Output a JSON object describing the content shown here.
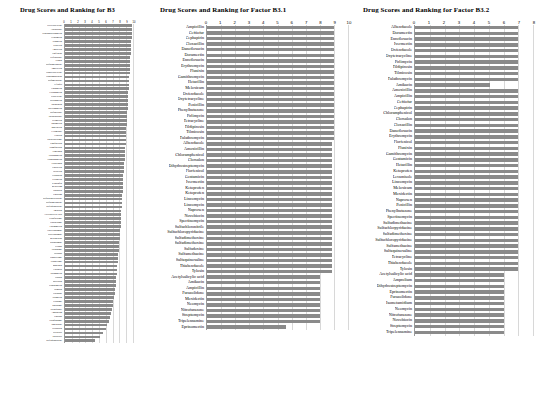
{
  "figure": {
    "background": "#ffffff",
    "bar_color": "#8a8a8a",
    "grid_color": "#d8d8d8",
    "axis_color": "#9a9a9a"
  },
  "chart_data": [
    {
      "id": "B3",
      "type": "bar",
      "orientation": "horizontal",
      "title": "Drug Scores and Ranking for B3",
      "xlabel": "",
      "ylabel": "",
      "xlim": [
        0,
        10
      ],
      "ticks": [
        "0",
        "1",
        "2",
        "3",
        "4",
        "5",
        "6",
        "7",
        "8",
        "9",
        "10"
      ],
      "grid": true,
      "legend": "none",
      "categories": [
        "Oxytetracycline",
        "Albendazole",
        "Dihydrostreptomycin",
        "Gentamicin",
        "Neomycin",
        "Penicillin",
        "Ampicillin",
        "Florfenicol",
        "Oxfendazole",
        "Tylosin",
        "Sulfadimethoxine",
        "Amoxicillin",
        "Chlortetracycline",
        "Chloramphenicol",
        "Sulfamethazine",
        "Ceftiofur",
        "Lincomycin",
        "Erythromycin",
        "Tetracycline",
        "Streptomycin",
        "Novobiocin",
        "Spectinomycin",
        "Sulfathiazole",
        "Thiabendazole",
        "Ivermectin",
        "Doramectin",
        "Moxidectin",
        "Levamisole",
        "Flunixin",
        "Phenylbutazone",
        "Enrofloxacin",
        "Danofloxacin",
        "Tilmicosin",
        "Tulathromycin",
        "Gamithromycin",
        "Tildipirosin",
        "Cloxacillin",
        "Hetacillin",
        "Cephapirin",
        "Pirlimycin",
        "Ketoprofen",
        "Meloxicam",
        "Naproxen",
        "Clorsulon",
        "Sulfachlorpyridazine",
        "Sulfadimethoxine",
        "Sulfaquinoxaline",
        "Amikacin",
        "Acetylsalicylic acid",
        "Nitrofurazone",
        "Furazolidone",
        "Eprinomectin",
        "Triplelennamine",
        "Tripelennamine",
        "Melengestrol",
        "Ractopamine",
        "Zeranol",
        "Trenbolone",
        "Estradiol",
        "Progesterone",
        "Testosterone",
        "Monensin",
        "Lasalocid",
        "Salinomycin",
        "Narasin",
        "Bacitracin",
        "Virginiamycin",
        "Tiamulin",
        "Carbadox",
        "Apramycin",
        "Nitarsone",
        "Roxarsone",
        "Decoquinate",
        "Amprolium",
        "Clopidol",
        "Halofuginone",
        "Robenidine",
        "Nicarbazin",
        "Diclazuril",
        "Toltrazuril",
        "Sulfaquinoxaline"
      ],
      "values": [
        9.9,
        9.85,
        9.8,
        9.8,
        9.75,
        9.7,
        9.7,
        9.65,
        9.6,
        9.6,
        9.55,
        9.5,
        9.5,
        9.45,
        9.4,
        9.4,
        9.35,
        9.3,
        9.3,
        9.25,
        9.2,
        9.2,
        9.15,
        9.1,
        9.1,
        9.05,
        9.0,
        9.0,
        8.95,
        8.9,
        8.9,
        8.85,
        8.8,
        8.8,
        8.75,
        8.7,
        8.7,
        8.65,
        8.6,
        8.6,
        8.55,
        8.5,
        8.5,
        8.45,
        8.4,
        8.4,
        8.35,
        8.3,
        8.3,
        8.25,
        8.2,
        8.2,
        8.15,
        8.1,
        8.05,
        8.0,
        7.95,
        7.9,
        7.85,
        7.8,
        7.75,
        7.7,
        7.65,
        7.6,
        7.55,
        7.5,
        7.45,
        7.4,
        7.3,
        7.2,
        7.1,
        7.0,
        6.9,
        6.8,
        6.6,
        6.4,
        6.2,
        6.0,
        5.6,
        5.2,
        4.4
      ]
    },
    {
      "id": "B3.1",
      "type": "bar",
      "orientation": "horizontal",
      "title": "Drug Scores and Ranking for Factor B3.1",
      "xlabel": "",
      "ylabel": "",
      "xlim": [
        0,
        10
      ],
      "ticks": [
        "0",
        "1",
        "2",
        "3",
        "4",
        "5",
        "6",
        "7",
        "8",
        "9",
        "10"
      ],
      "grid": true,
      "legend": "none",
      "categories": [
        "Ampicillin",
        "Ceftiofur",
        "Cephapirin",
        "Cloxacillin",
        "Danofloxacin",
        "Doramectin",
        "Enrofloxacin",
        "Erythromycin",
        "Flunixin",
        "Gamithromycin",
        "Hetacillin",
        "Meloxicam",
        "Oxfendazole",
        "Oxytetracycline",
        "Penicillin",
        "Phenylbutazone",
        "Pirlimycin",
        "Tetracycline",
        "Tildipirosin",
        "Tilmicosin",
        "Tulathromycin",
        "Albendazole",
        "Amoxicillin",
        "Chloramphenicol",
        "Clorsulon",
        "Dihydrostreptomycin",
        "Florfenicol",
        "Gentamicin",
        "Ivermectin",
        "Ketoprofen",
        "Ketoprofen",
        "Lincomycin",
        "Lincomycin",
        "Naproxen",
        "Novobiocin",
        "Spectinomycin",
        "Sulfachloronitrile",
        "Sulfachloropyridazine",
        "Sulfadimethoxine",
        "Sulfadimethoxine",
        "Sulfadoxine",
        "Sulfamethazine",
        "Sulfaquinoxaline",
        "Thiabendazole",
        "Tylosin",
        "Acetylsalicylic acid",
        "Amikacin",
        "Ampicillin",
        "Furazolidone",
        "Moxidectin",
        "Neomycin",
        "Nitrofurazone",
        "Streptomycin",
        "Tripelennamine",
        "Eprinomectin"
      ],
      "values": [
        9.0,
        9.0,
        9.0,
        9.0,
        9.0,
        9.0,
        9.0,
        9.0,
        9.0,
        9.0,
        9.0,
        9.0,
        9.0,
        9.0,
        9.0,
        9.0,
        9.0,
        9.0,
        9.0,
        9.0,
        9.0,
        8.9,
        8.9,
        8.9,
        8.9,
        8.9,
        8.9,
        8.9,
        8.9,
        8.9,
        8.9,
        8.9,
        8.9,
        8.9,
        8.9,
        8.9,
        8.9,
        8.9,
        8.9,
        8.9,
        8.9,
        8.9,
        8.9,
        8.9,
        8.9,
        8.0,
        8.0,
        8.0,
        8.0,
        8.0,
        8.0,
        8.0,
        8.0,
        8.0,
        5.6
      ]
    },
    {
      "id": "B3.2",
      "type": "bar",
      "orientation": "horizontal",
      "title": "Drug Scores and Ranking for Factor B3.2",
      "xlabel": "",
      "ylabel": "",
      "xlim": [
        0,
        8
      ],
      "ticks": [
        "0",
        "1",
        "2",
        "3",
        "4",
        "5",
        "6",
        "7",
        "8"
      ],
      "grid": true,
      "legend": "none",
      "categories": [
        "Albendazole",
        "Doramectin",
        "Enrofloxacin",
        "Ivermectin",
        "Oxfendazole",
        "Oxytetracycline",
        "Pirlimycin",
        "Tildipirosin",
        "Tilmicosin",
        "Tulathromycin",
        "Amikacin",
        "Amoxicillin",
        "Ampicillin",
        "Ceftiofur",
        "Cephapirin",
        "Chloramphenicol",
        "Clorsulon",
        "Cloxacillin",
        "Danofloxacin",
        "Erythromycin",
        "Florfenicol",
        "Flunixin",
        "Gamithromycin",
        "Gentamicin",
        "Hetacillin",
        "Ketoprofen",
        "Levamisole",
        "Lincomycin",
        "Meloxicam",
        "Moxidectin",
        "Naproxen",
        "Penicillin",
        "Phenylbutazone",
        "Spectinomycin",
        "Sulfadimethazine",
        "Sulfachlorpyridazine",
        "Sulfadimethoxine",
        "Sulfachloropyridazine",
        "Sulfamethazine",
        "Sulfaquinoxaline",
        "Tetracycline",
        "Thiabendazole",
        "Tylosin",
        "Acetylsalicylic acid",
        "Amprolium",
        "Dihydrostreptomycin",
        "Eprinomectin",
        "Furazolidone",
        "Isometamidium",
        "Neomycin",
        "Nitrofurazone",
        "Novobiocin",
        "Streptomycin",
        "Tripelennamine"
      ],
      "values": [
        7.0,
        7.0,
        7.0,
        7.0,
        7.0,
        7.0,
        7.0,
        7.0,
        7.0,
        7.0,
        5.1,
        7.0,
        7.0,
        7.0,
        7.0,
        7.0,
        7.0,
        7.0,
        7.0,
        7.0,
        7.0,
        7.0,
        7.0,
        7.0,
        7.0,
        7.0,
        7.0,
        7.0,
        7.0,
        7.0,
        7.0,
        7.0,
        7.0,
        7.0,
        7.0,
        7.0,
        7.0,
        7.0,
        7.0,
        7.0,
        7.0,
        7.0,
        7.0,
        6.0,
        6.0,
        6.0,
        6.0,
        6.0,
        6.0,
        6.0,
        6.0,
        6.0,
        6.0,
        6.0
      ]
    }
  ]
}
